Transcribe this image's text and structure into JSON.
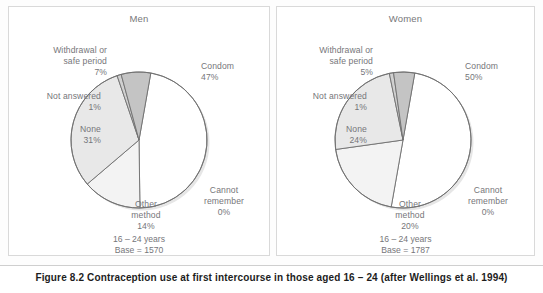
{
  "figure": {
    "caption": "Figure 8.2  Contraception use at first intercourse in those aged 16 – 24 (after Wellings et al. 1994)"
  },
  "colors": {
    "slice_condom": "#ffffff",
    "slice_cannot_remember": "#ffffff",
    "slice_other_method": "#f3f3f3",
    "slice_none": "#e8e8e8",
    "slice_not_answered": "#d0d0d0",
    "slice_withdrawal": "#c4c4c4",
    "outline": "#6f6f6f",
    "text": "#76767a",
    "panel_border": "#d9d9d9",
    "caption_text": "#1d1d1d"
  },
  "panels": [
    {
      "id": "men",
      "title": "Men",
      "age_note": "16 – 24 years",
      "base_note": "Base = 1570"
    },
    {
      "id": "women",
      "title": "Women",
      "age_note": "16 – 24 years",
      "base_note": "Base = 1787"
    }
  ],
  "chart_data": [
    {
      "type": "pie",
      "title": "Men",
      "subtitle": "16 – 24 years, Base = 1570",
      "base": 1570,
      "age_range": "16 – 24",
      "labels": [
        "Condom",
        "Cannot remember",
        "Other method",
        "None",
        "Not answered",
        "Withdrawal or safe period"
      ],
      "values": [
        47,
        0,
        14,
        31,
        1,
        7
      ],
      "unit": "%",
      "slice_labels": [
        "Condom\n47%",
        "Cannot\nremember\n0%",
        "Other\nmethod\n14%",
        "None\n31%",
        "Not answered\n1%",
        "Withdrawal or\nsafe period\n7%"
      ],
      "legend": "none",
      "grid": false
    },
    {
      "type": "pie",
      "title": "Women",
      "subtitle": "16 – 24 years, Base = 1787",
      "base": 1787,
      "age_range": "16 – 24",
      "labels": [
        "Condom",
        "Cannot remember",
        "Other method",
        "None",
        "Not answered",
        "Withdrawal or safe period"
      ],
      "values": [
        50,
        0,
        20,
        24,
        1,
        5
      ],
      "unit": "%",
      "slice_labels": [
        "Condom\n50%",
        "Cannot\nremember\n0%",
        "Other\nmethod\n20%",
        "None\n24%",
        "Not answered\n1%",
        "Withdrawal or\nsafe period\n5%"
      ],
      "legend": "none",
      "grid": false
    }
  ]
}
